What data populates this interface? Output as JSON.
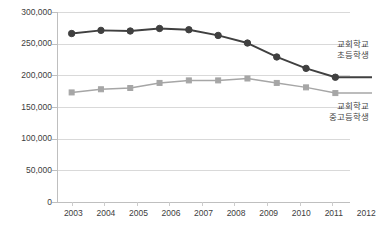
{
  "chart_data": {
    "type": "line",
    "title": "",
    "subtitle": "",
    "xlabel": "",
    "ylabel": "",
    "categories": [
      "2003",
      "2004",
      "2005",
      "2006",
      "2007",
      "2008",
      "2009",
      "2010",
      "2011",
      "2012"
    ],
    "ylim": [
      0,
      300000
    ],
    "ytick_values": [
      0,
      50000,
      100000,
      150000,
      200000,
      250000,
      300000
    ],
    "ytick_labels": [
      "0",
      "50,000",
      "100,000",
      "150,000",
      "200,000",
      "250,000",
      "300,000"
    ],
    "grid": true,
    "legend_position": "inline-right",
    "series": [
      {
        "name": "교회학교 초등학생",
        "name_line1": "교회학교",
        "name_line2": "초등학생",
        "color": "#404040",
        "marker": "circle",
        "values": [
          266000,
          271000,
          270000,
          274000,
          272000,
          263000,
          251000,
          229000,
          211000,
          197000
        ]
      },
      {
        "name": "교회학교 중고등학생",
        "name_line1": "교회학교",
        "name_line2": "중고등학생",
        "color": "#a6a6a6",
        "marker": "square",
        "values": [
          173000,
          178000,
          180000,
          188000,
          192000,
          192000,
          195000,
          188000,
          181000,
          172000
        ]
      }
    ]
  },
  "axes": {
    "y": {
      "labels": [
        "300,000",
        "250,000",
        "200,000",
        "150,000",
        "100,000",
        "50,000",
        "0"
      ]
    },
    "x": {
      "labels": [
        "2003",
        "2004",
        "2005",
        "2006",
        "2007",
        "2008",
        "2009",
        "2010",
        "2011",
        "2012"
      ]
    }
  },
  "legend": {
    "primary": {
      "line1": "교회학교",
      "line2": "초등학생"
    },
    "secondary": {
      "line1": "교회학교",
      "line2": "중고등학생"
    }
  },
  "colors": {
    "series_primary": "#404040",
    "series_secondary": "#a6a6a6",
    "gridline": "#d9d9d9",
    "axis": "#bfbfbf",
    "background": "#ffffff",
    "text": "#404040"
  }
}
